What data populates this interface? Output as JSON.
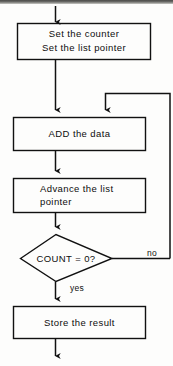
{
  "diagram": {
    "type": "flowchart",
    "ink_color": "#111111",
    "background_color": "#fdfdfc",
    "nodes": [
      {
        "id": "set-counter",
        "shape": "process",
        "line1": "Set the counter",
        "line2": "Set the list pointer"
      },
      {
        "id": "add-data",
        "shape": "process",
        "line1": "ADD the data",
        "line2": ""
      },
      {
        "id": "advance-pointer",
        "shape": "process",
        "line1": "Advance the list",
        "line2": "pointer"
      },
      {
        "id": "count-decision",
        "shape": "decision",
        "line1": "COUNT = 0?",
        "line2": ""
      },
      {
        "id": "store-result",
        "shape": "process",
        "line1": "Store the result",
        "line2": ""
      }
    ],
    "edge_labels": {
      "no": "no",
      "yes": "yes"
    }
  }
}
